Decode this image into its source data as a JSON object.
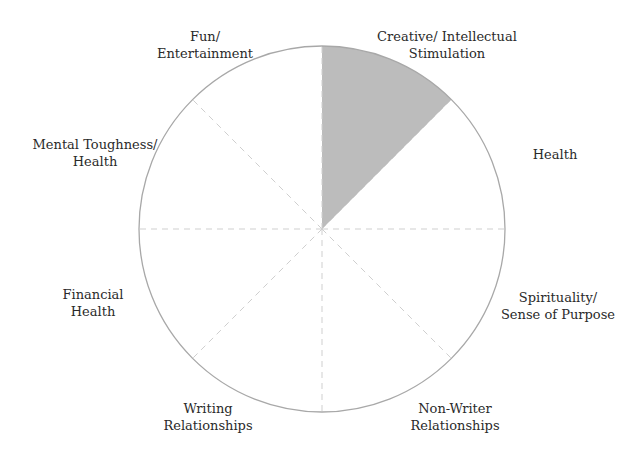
{
  "wheel": {
    "center": [
      322,
      229
    ],
    "radius": 183,
    "outline_color": "#a8a8a8",
    "divider_color": "#c8c8c8",
    "fill_color": "#b8b8b8",
    "segments": [
      {
        "label": "Creative/ Intellectual\nStimulation",
        "filled": true,
        "fill_fraction": 1.0
      },
      {
        "label": "Health",
        "filled": false,
        "fill_fraction": 0
      },
      {
        "label": "Spirituality/\nSense of Purpose",
        "filled": false,
        "fill_fraction": 0
      },
      {
        "label": "Non-Writer\nRelationships",
        "filled": false,
        "fill_fraction": 0
      },
      {
        "label": "Writing\nRelationships",
        "filled": false,
        "fill_fraction": 0
      },
      {
        "label": "Financial\nHealth",
        "filled": false,
        "fill_fraction": 0
      },
      {
        "label": "Mental Toughness/\nHealth",
        "filled": false,
        "fill_fraction": 0
      },
      {
        "label": "Fun/\nEntertainment",
        "filled": false,
        "fill_fraction": 0
      }
    ]
  },
  "labels": {
    "creative": "Creative/ Intellectual\nStimulation",
    "health": "Health",
    "spirituality": "Spirituality/\nSense of Purpose",
    "non_writer": "Non-Writer\nRelationships",
    "writing": "Writing\nRelationships",
    "financial": "Financial\nHealth",
    "mental": "Mental Toughness/\nHealth",
    "fun": "Fun/\nEntertainment"
  }
}
